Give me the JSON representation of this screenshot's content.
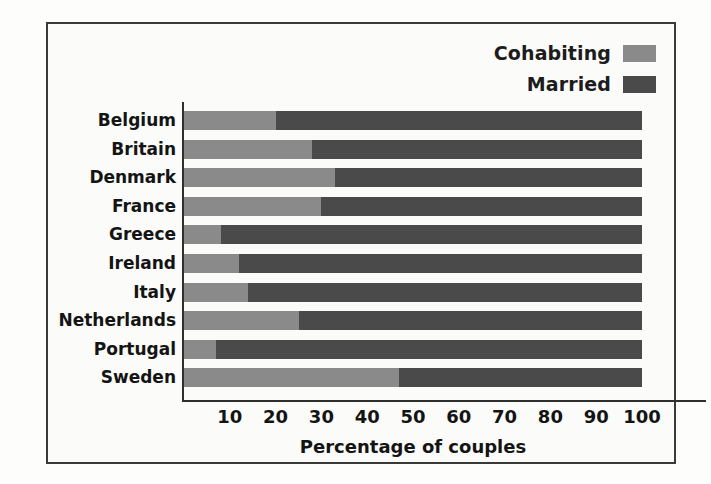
{
  "chart_data": {
    "type": "bar",
    "orientation": "horizontal",
    "stacked": true,
    "title": "",
    "xlabel": "Percentage of couples",
    "ylabel": "",
    "xlim": [
      0,
      100
    ],
    "xticks": [
      10,
      20,
      30,
      40,
      50,
      60,
      70,
      80,
      90,
      100
    ],
    "grid": false,
    "legend_position": "top-right",
    "categories": [
      "Belgium",
      "Britain",
      "Denmark",
      "France",
      "Greece",
      "Ireland",
      "Italy",
      "Netherlands",
      "Portugal",
      "Sweden"
    ],
    "series": [
      {
        "name": "Cohabiting",
        "color": "#8a8a8a",
        "values": [
          20,
          28,
          33,
          30,
          8,
          12,
          14,
          25,
          7,
          47
        ]
      },
      {
        "name": "Married",
        "color": "#4a4a4a",
        "values": [
          80,
          72,
          67,
          70,
          92,
          88,
          86,
          75,
          93,
          53
        ]
      }
    ]
  },
  "legend": {
    "items": [
      {
        "label": "Cohabiting",
        "color": "#8a8a8a"
      },
      {
        "label": "Married",
        "color": "#4a4a4a"
      }
    ]
  },
  "axis": {
    "x_title": "Percentage of couples",
    "ticks": [
      "10",
      "20",
      "30",
      "40",
      "50",
      "60",
      "70",
      "80",
      "90",
      "100"
    ]
  }
}
